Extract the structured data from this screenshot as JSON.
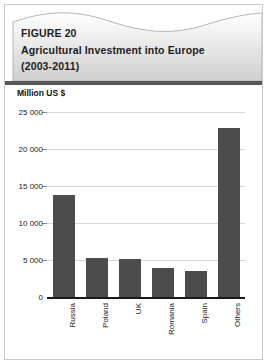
{
  "figure": {
    "number": "FIGURE 20",
    "title": "Agricultural Investment into Europe",
    "period": "(2003-2011)"
  },
  "chart_data": {
    "type": "bar",
    "title": "Agricultural Investment into Europe (2003-2011)",
    "unit_label": "Million US $",
    "xlabel": "",
    "ylabel": "Million US $",
    "categories": [
      "Russia",
      "Poland",
      "UK",
      "Romania",
      "Spain",
      "Others"
    ],
    "values": [
      13800,
      5250,
      5150,
      3950,
      3500,
      22800
    ],
    "ylim": [
      0,
      25000
    ],
    "yticks": [
      0,
      5000,
      10000,
      15000,
      20000,
      25000
    ],
    "ytick_labels": [
      "0",
      "5 000",
      "10 000",
      "15 000",
      "20 000",
      "25 000"
    ],
    "grid": true,
    "legend": "none",
    "bar_color": "#4c4c4c",
    "grid_color": "#d7d7d7",
    "axis_color": "#1a1a1a"
  },
  "style": {
    "header_band_color": "#575757",
    "header_gradient_top": "#ffffff",
    "header_gradient_bottom": "#d0d0d0",
    "card_border": "#c9c9c9",
    "page_background": "#ffffff"
  }
}
